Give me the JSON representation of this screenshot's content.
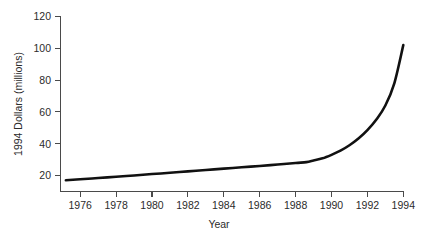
{
  "chart_data": {
    "type": "line",
    "title": "",
    "subtitle": "",
    "xlabel": "Year",
    "ylabel": "1994 Dollars (millions)",
    "xlim": [
      1974.6,
      1994.2
    ],
    "ylim": [
      10,
      126
    ],
    "grid": false,
    "legend": false,
    "legend_position": "none",
    "x_ticks": [
      1976,
      1978,
      1980,
      1982,
      1984,
      1986,
      1988,
      1990,
      1992,
      1994
    ],
    "x_tick_labels": [
      "1976",
      "1978",
      "1980",
      "1982",
      "1984",
      "1986",
      "1988",
      "1990",
      "1992",
      "1994"
    ],
    "y_ticks": [
      20,
      40,
      60,
      80,
      100,
      120
    ],
    "y_tick_labels": [
      "20",
      "40",
      "60",
      "80",
      "100",
      "120"
    ],
    "series": [
      {
        "name": "1994 Dollars (millions)",
        "color": "#111111",
        "x": [
          1975.2,
          1976,
          1977,
          1978,
          1979,
          1980,
          1981,
          1982,
          1983,
          1984,
          1985,
          1986,
          1987,
          1988,
          1988.6,
          1989,
          1989.5,
          1990,
          1990.5,
          1991,
          1991.5,
          1992,
          1992.5,
          1993,
          1993.5,
          1994
        ],
        "y": [
          17.0,
          17.6,
          18.4,
          19.2,
          20.0,
          20.9,
          21.7,
          22.6,
          23.5,
          24.3,
          25.2,
          26.0,
          26.9,
          27.9,
          28.4,
          29.4,
          30.8,
          33.0,
          35.6,
          39.0,
          43.2,
          48.5,
          55.2,
          64.0,
          78.0,
          102.0
        ]
      }
    ],
    "annotations": []
  },
  "axes": {
    "x_axis_name": "Year",
    "y_axis_name": "1994 Dollars (millions)"
  },
  "colors": {
    "line": "#111111",
    "axis": "#4a4a4a",
    "text": "#2b2b2b",
    "background": "#ffffff"
  }
}
